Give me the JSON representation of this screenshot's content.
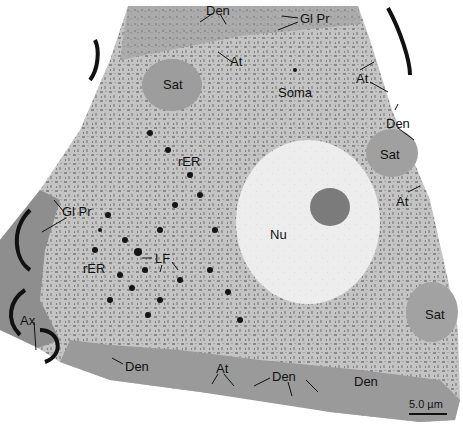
{
  "figure": {
    "type": "electron-micrograph",
    "labels": [
      {
        "id": "den-top",
        "text": "Den",
        "x": 206,
        "y": 4
      },
      {
        "id": "glpr-top",
        "text": "Gl Pr",
        "x": 300,
        "y": 12
      },
      {
        "id": "at-top",
        "text": "At",
        "x": 230,
        "y": 55
      },
      {
        "id": "sat-top",
        "text": "Sat",
        "x": 163,
        "y": 78
      },
      {
        "id": "soma",
        "text": "Soma",
        "x": 278,
        "y": 86
      },
      {
        "id": "at-right-top",
        "text": "At",
        "x": 356,
        "y": 72
      },
      {
        "id": "den-right",
        "text": "Den",
        "x": 386,
        "y": 117
      },
      {
        "id": "sat-right",
        "text": "Sat",
        "x": 380,
        "y": 148
      },
      {
        "id": "at-right",
        "text": "At",
        "x": 396,
        "y": 195
      },
      {
        "id": "rer-upper",
        "text": "rER",
        "x": 178,
        "y": 155
      },
      {
        "id": "nu",
        "text": "Nu",
        "x": 270,
        "y": 228
      },
      {
        "id": "glpr-left",
        "text": "Gl Pr",
        "x": 62,
        "y": 205
      },
      {
        "id": "lf",
        "text": "LF",
        "x": 155,
        "y": 252
      },
      {
        "id": "rer-lower",
        "text": "rER",
        "x": 83,
        "y": 262
      },
      {
        "id": "ax",
        "text": "Ax",
        "x": 20,
        "y": 314
      },
      {
        "id": "sat-lower-right",
        "text": "Sat",
        "x": 425,
        "y": 308
      },
      {
        "id": "den-bottom-left",
        "text": "Den",
        "x": 125,
        "y": 360
      },
      {
        "id": "at-bottom",
        "text": "At",
        "x": 216,
        "y": 362
      },
      {
        "id": "den-bottom-mid",
        "text": "Den",
        "x": 272,
        "y": 370
      },
      {
        "id": "den-bottom-right",
        "text": "Den",
        "x": 354,
        "y": 375
      }
    ],
    "scale_bar": {
      "text": "5.0 µm",
      "x": 409,
      "y": 396,
      "bar_x": 409,
      "bar_y": 413,
      "bar_width": 38
    }
  },
  "colors": {
    "cytoplasm": "#b9b9b9",
    "nucleus": "#ececec",
    "nucleolus": "#7a7a7a",
    "glial": "#8f8f8f",
    "background": "#ffffff"
  }
}
